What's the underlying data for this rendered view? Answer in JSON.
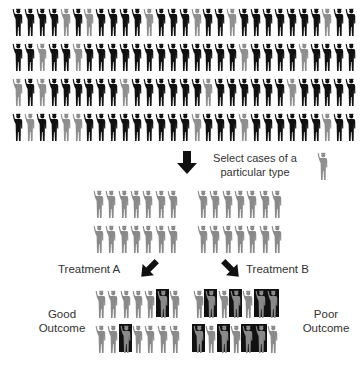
{
  "colors": {
    "dark": "#111111",
    "light": "#8f8f8f",
    "selected": "#8a8a8a",
    "highlight_box": "#111111"
  },
  "population": {
    "description": "Mixed population; B = dark figure, G = light gray figure",
    "rows": [
      "BBBBGBGBBBBGBBBGBBGBBBBBBBGBB",
      "BBGBBGBBBBBBBBBBBBBGBBBBGBBBB",
      "GBGBBBBBBGBBBBBBGBBBBBBGBBBBB",
      "BGBBGGBBBBBBBBBGBBBGBBBBBBGBB"
    ]
  },
  "selection": {
    "label_line1": "Select cases of a",
    "label_line2": "particular type",
    "icon": "gray-person-icon",
    "arrow": "arrow-down-icon"
  },
  "selected_groups": [
    {
      "name": "group-left",
      "rows": [
        7,
        7
      ]
    },
    {
      "name": "group-right",
      "rows": [
        7,
        7
      ]
    }
  ],
  "treatments": [
    {
      "label": "Treatment A",
      "arrow": "arrow-down-left-icon"
    },
    {
      "label": "Treatment B",
      "arrow": "arrow-down-right-icon"
    }
  ],
  "outcomes": {
    "good": {
      "line1": "Good",
      "line2": "Outcome"
    },
    "poor": {
      "line1": "Poor",
      "line2": "Outcome"
    }
  },
  "outcome_groups": {
    "treatment_a": {
      "highlighted": [
        [
          6
        ],
        [
          3
        ]
      ]
    },
    "treatment_b": {
      "highlighted": [
        [
          2,
          4,
          6,
          7
        ],
        [
          1,
          3,
          5,
          6
        ]
      ]
    }
  }
}
